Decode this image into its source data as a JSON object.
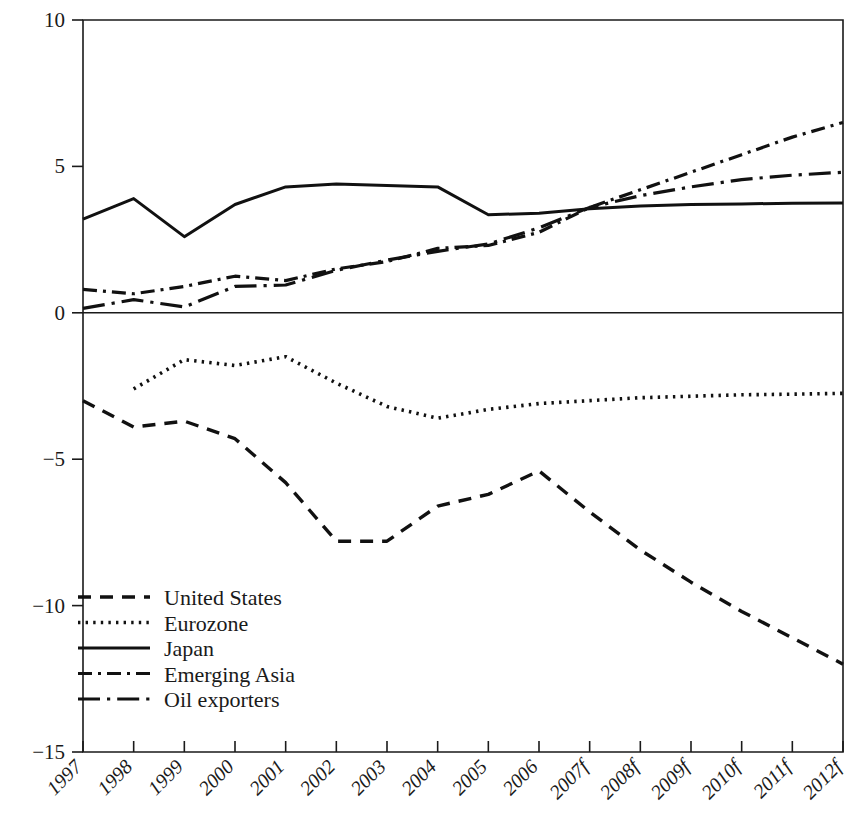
{
  "chart_data": {
    "type": "line",
    "title": "",
    "xlabel": "",
    "ylabel": "",
    "ylim": [
      -15,
      10
    ],
    "yticks": [
      10,
      5,
      0,
      -5,
      -10,
      -15
    ],
    "ytick_labels": [
      "10",
      "5",
      "0",
      "−5",
      "−10",
      "−15"
    ],
    "grid": false,
    "legend_position": "lower-left",
    "categories": [
      "1997",
      "1998",
      "1999",
      "2000",
      "2001",
      "2002",
      "2003",
      "2004",
      "2005",
      "2006",
      "2007f",
      "2008f",
      "2009f",
      "2010f",
      "2011f",
      "2012f"
    ],
    "series": [
      {
        "name": "United States",
        "style": "dashed",
        "values": [
          -3.0,
          -3.9,
          -3.7,
          -4.3,
          -5.8,
          -7.8,
          -7.8,
          -6.6,
          -6.2,
          -5.4,
          -6.8,
          -8.1,
          -9.2,
          -10.2,
          -11.1,
          -12.0
        ]
      },
      {
        "name": "Eurozone",
        "style": "dotted",
        "values": [
          null,
          -2.6,
          -1.6,
          -1.8,
          -1.5,
          -2.4,
          -3.2,
          -3.6,
          -3.3,
          -3.1,
          -3.0,
          -2.9,
          -2.85,
          -2.8,
          -2.78,
          -2.75
        ]
      },
      {
        "name": "Japan",
        "style": "solid",
        "values": [
          3.2,
          3.9,
          2.6,
          3.7,
          4.3,
          4.4,
          4.35,
          4.3,
          3.35,
          3.4,
          3.55,
          3.65,
          3.7,
          3.72,
          3.74,
          3.75
        ]
      },
      {
        "name": "Emerging Asia",
        "style": "dash-dot-short",
        "values": [
          0.8,
          0.65,
          0.9,
          1.25,
          1.1,
          1.5,
          1.75,
          2.2,
          2.3,
          2.75,
          3.6,
          4.2,
          4.8,
          5.4,
          6.0,
          6.5
        ]
      },
      {
        "name": "Oil exporters",
        "style": "dash-dot-long",
        "values": [
          0.15,
          0.45,
          0.2,
          0.9,
          0.95,
          1.45,
          1.8,
          2.1,
          2.35,
          2.9,
          3.6,
          4.0,
          4.3,
          4.55,
          4.7,
          4.8
        ]
      }
    ]
  },
  "legend": {
    "items": [
      {
        "label": "United States"
      },
      {
        "label": "Eurozone"
      },
      {
        "label": "Japan"
      },
      {
        "label": "Emerging Asia"
      },
      {
        "label": "Oil exporters"
      }
    ]
  },
  "axes": {
    "y_labels": [
      "10",
      "5",
      "0",
      "−5",
      "−10",
      "−15"
    ],
    "x_labels": [
      "1997",
      "1998",
      "1999",
      "2000",
      "2001",
      "2002",
      "2003",
      "2004",
      "2005",
      "2006",
      "2007f",
      "2008f",
      "2009f",
      "2010f",
      "2011f",
      "2012f"
    ]
  },
  "colors": {
    "ink": "#111111",
    "background": "#ffffff"
  }
}
